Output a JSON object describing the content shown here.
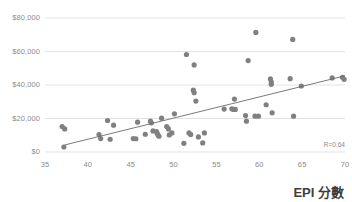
{
  "chart_data": {
    "type": "scatter",
    "title": "",
    "xlabel": "EPI 分數",
    "ylabel": "",
    "xlim": [
      35,
      70
    ],
    "ylim": [
      0,
      80000
    ],
    "grid": true,
    "gridlines": "horizontal",
    "legend": null,
    "xticks": [
      "35",
      "40",
      "45",
      "50",
      "55",
      "60",
      "65",
      "70"
    ],
    "xtick_values": [
      35,
      40,
      45,
      50,
      55,
      60,
      65,
      70
    ],
    "yticks": [
      "$0",
      "$20,000",
      "$40,000",
      "$60,000",
      "$80,000"
    ],
    "ytick_values": [
      0,
      20000,
      40000,
      60000,
      80000
    ],
    "annotations": [
      {
        "text": "R=0.64",
        "position": "bottom-right"
      }
    ],
    "marker_color": "#808080",
    "trendline_color": "#6b6b6b",
    "gridline_color": "#dcdcdc",
    "axis_text_color": "#8c8c8c",
    "trendline": {
      "x0": 37.3,
      "y0": 4200,
      "x1": 70.0,
      "y1": 45500
    },
    "points": [
      {
        "x": 37.0,
        "y": 15200
      },
      {
        "x": 37.3,
        "y": 13800
      },
      {
        "x": 37.2,
        "y": 3000
      },
      {
        "x": 41.3,
        "y": 10400
      },
      {
        "x": 41.5,
        "y": 8000
      },
      {
        "x": 42.3,
        "y": 18800
      },
      {
        "x": 42.6,
        "y": 7600
      },
      {
        "x": 43.0,
        "y": 16000
      },
      {
        "x": 45.3,
        "y": 8000
      },
      {
        "x": 45.6,
        "y": 7900
      },
      {
        "x": 45.8,
        "y": 17800
      },
      {
        "x": 46.7,
        "y": 10600
      },
      {
        "x": 47.3,
        "y": 18400
      },
      {
        "x": 47.4,
        "y": 17400
      },
      {
        "x": 47.6,
        "y": 12600
      },
      {
        "x": 48.0,
        "y": 12200
      },
      {
        "x": 48.1,
        "y": 11200
      },
      {
        "x": 48.2,
        "y": 10000
      },
      {
        "x": 48.3,
        "y": 9400
      },
      {
        "x": 48.6,
        "y": 20200
      },
      {
        "x": 49.2,
        "y": 15200
      },
      {
        "x": 49.4,
        "y": 13800
      },
      {
        "x": 49.5,
        "y": 10200
      },
      {
        "x": 49.8,
        "y": 11400
      },
      {
        "x": 50.1,
        "y": 22800
      },
      {
        "x": 51.2,
        "y": 5200
      },
      {
        "x": 51.5,
        "y": 58200
      },
      {
        "x": 51.8,
        "y": 11400
      },
      {
        "x": 52.0,
        "y": 10400
      },
      {
        "x": 52.4,
        "y": 52000
      },
      {
        "x": 52.3,
        "y": 37000
      },
      {
        "x": 52.4,
        "y": 35400
      },
      {
        "x": 52.6,
        "y": 30400
      },
      {
        "x": 52.9,
        "y": 9000
      },
      {
        "x": 53.4,
        "y": 5400
      },
      {
        "x": 53.6,
        "y": 11400
      },
      {
        "x": 55.9,
        "y": 25600
      },
      {
        "x": 56.8,
        "y": 25800
      },
      {
        "x": 57.0,
        "y": 25400
      },
      {
        "x": 57.2,
        "y": 25400
      },
      {
        "x": 57.1,
        "y": 31600
      },
      {
        "x": 58.4,
        "y": 21800
      },
      {
        "x": 58.5,
        "y": 18400
      },
      {
        "x": 58.7,
        "y": 54600
      },
      {
        "x": 59.6,
        "y": 71400
      },
      {
        "x": 59.5,
        "y": 21400
      },
      {
        "x": 59.9,
        "y": 21400
      },
      {
        "x": 60.8,
        "y": 28200
      },
      {
        "x": 61.3,
        "y": 43600
      },
      {
        "x": 61.4,
        "y": 41800
      },
      {
        "x": 61.4,
        "y": 40400
      },
      {
        "x": 61.5,
        "y": 23400
      },
      {
        "x": 63.6,
        "y": 43800
      },
      {
        "x": 63.9,
        "y": 67200
      },
      {
        "x": 64.0,
        "y": 21400
      },
      {
        "x": 64.9,
        "y": 39400
      },
      {
        "x": 68.5,
        "y": 44200
      },
      {
        "x": 69.7,
        "y": 44600
      },
      {
        "x": 69.9,
        "y": 43400
      }
    ]
  },
  "plot_area": {
    "left": 45,
    "right": 345,
    "top": 18,
    "bottom": 152
  }
}
